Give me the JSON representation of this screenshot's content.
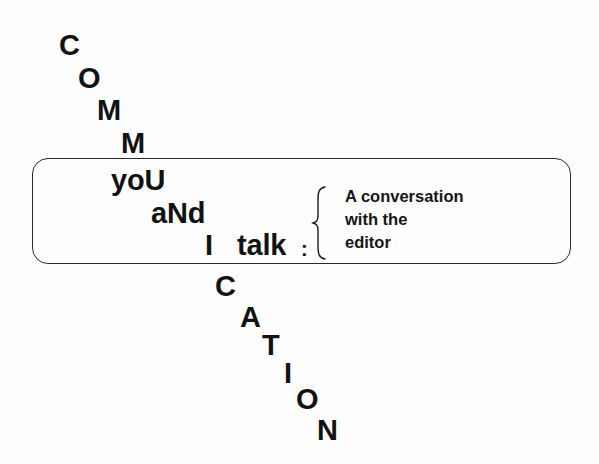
{
  "title_art": {
    "descending_letters_top": [
      {
        "char": "C",
        "x": 59,
        "y": 31
      },
      {
        "char": "O",
        "x": 78,
        "y": 64
      },
      {
        "char": "M",
        "x": 97,
        "y": 96
      },
      {
        "char": "M",
        "x": 121,
        "y": 129
      }
    ],
    "inline_words": [
      {
        "text": "yoU",
        "x": 111,
        "y": 166
      },
      {
        "text": "aNd",
        "x": 151,
        "y": 199
      },
      {
        "text": "I",
        "x": 205,
        "y": 231
      },
      {
        "text": "talk",
        "x": 237,
        "y": 231
      }
    ],
    "colon": ":",
    "descending_letters_bottom": [
      {
        "char": "C",
        "x": 215,
        "y": 272
      },
      {
        "char": "A",
        "x": 240,
        "y": 303
      },
      {
        "char": "T",
        "x": 262,
        "y": 331
      },
      {
        "char": "I",
        "x": 284,
        "y": 359
      },
      {
        "char": "O",
        "x": 296,
        "y": 385
      },
      {
        "char": "N",
        "x": 317,
        "y": 416
      }
    ],
    "hidden_word": "COMMUNICATION"
  },
  "subtitle": {
    "lines": [
      "A conversation",
      "with the",
      "editor"
    ]
  },
  "colors": {
    "ink": "#121212",
    "frame": "#2a2a2a",
    "background": "#fefefe"
  }
}
